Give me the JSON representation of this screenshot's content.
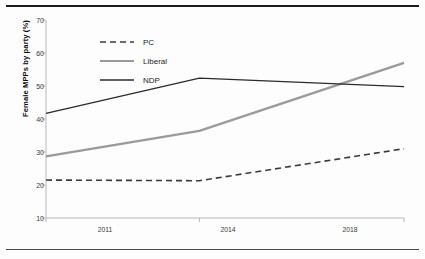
{
  "figure": {
    "top_rule": "horizontal-rule",
    "bottom_rule": "horizontal-rule"
  },
  "chart_data": {
    "type": "line",
    "title": "",
    "subtitle": "",
    "xlabel": "",
    "ylabel": "Female MPPs by party (%)",
    "categories": [
      "2011",
      "2014",
      "2018"
    ],
    "x": [
      2011,
      2014,
      2018
    ],
    "ylim": [
      10,
      70
    ],
    "yticks": [
      10,
      20,
      30,
      40,
      50,
      60,
      70
    ],
    "ytick_labels": [
      "10",
      "20",
      "30",
      "40",
      "50",
      "60",
      "70"
    ],
    "xtick_labels": [
      "2011",
      "2014",
      "2018"
    ],
    "grid": false,
    "legend_position": "upper-left-inside",
    "series": [
      {
        "name": "PC",
        "values": [
          21.5,
          21.3,
          31.0
        ],
        "color": "#3b3b3b",
        "style": "dashed",
        "width": 1.6
      },
      {
        "name": "Liberal",
        "values": [
          28.7,
          36.4,
          57.0
        ],
        "color": "#9a9a9a",
        "style": "solid",
        "width": 2.2
      },
      {
        "name": "NDP",
        "values": [
          41.7,
          52.4,
          49.8
        ],
        "color": "#2b2b2b",
        "style": "solid",
        "width": 1.4
      }
    ],
    "annotations": []
  },
  "legend": {
    "items": [
      {
        "label": "PC"
      },
      {
        "label": "Liberal"
      },
      {
        "label": "NDP"
      }
    ]
  }
}
